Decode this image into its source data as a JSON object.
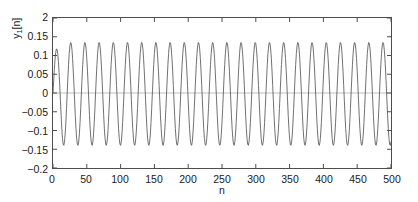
{
  "chart_data": {
    "type": "line",
    "title": "",
    "xlabel": "n",
    "ylabel": "y_1[n]",
    "ylabel_base": "y",
    "ylabel_sub": "1",
    "ylabel_rest": "[n]",
    "xlim": [
      0,
      500
    ],
    "ylim": [
      -0.2,
      0.2
    ],
    "xticks": [
      0,
      50,
      100,
      150,
      200,
      250,
      300,
      350,
      400,
      450,
      500
    ],
    "xtick_labels": [
      "0",
      "50",
      "100",
      "150",
      "200",
      "250",
      "300",
      "350",
      "400",
      "450",
      "500"
    ],
    "yticks": [
      0.2,
      0.15,
      0.1,
      0.05,
      0,
      -0.05,
      -0.1,
      -0.15,
      -0.2
    ],
    "ytick_labels": [
      "0.2",
      "0.15",
      "0.1",
      "0.05",
      "0",
      "−0.05",
      "−0.1",
      "−0.15",
      "−0.2"
    ],
    "ytick_label_top_clipped": "2",
    "grid": false,
    "legend": null,
    "zero_line": true,
    "line_color": "#4d4d4d",
    "axes_color": "#4d4d4d",
    "zero_line_color": "#bfbfbf",
    "background": "#ffffff",
    "series": [
      {
        "name": "y_1[n]",
        "description": "Steady sinusoidal oscillation of amplitude about 0.135 and period about 21 samples, with a brief startup transient over the first period where the initial trough only reaches about -0.115.",
        "amplitude": 0.135,
        "period_samples": 21,
        "frequency_cycles_per_sample": 0.0476,
        "phase_radians": 0.0,
        "n_start": 0,
        "n_end": 500,
        "transient_end_sample": 14,
        "transient_first_trough": -0.115,
        "steady_peak": 0.135,
        "steady_trough": -0.14,
        "approx_cycle_count": 24
      }
    ]
  }
}
